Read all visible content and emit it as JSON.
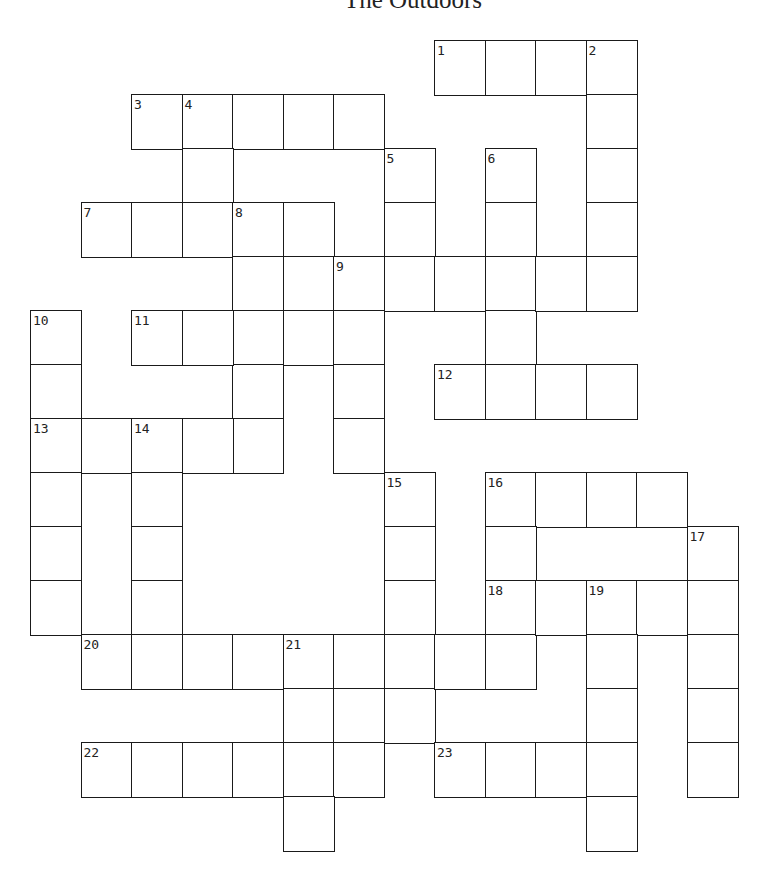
{
  "title": "The Outdoors",
  "grid": {
    "origin": [
      30,
      40
    ],
    "cell_w": 50.5,
    "cell_h": 54,
    "border_color": "#1a1a1a",
    "cells": [
      [
        8,
        0,
        "1"
      ],
      [
        9,
        0
      ],
      [
        10,
        0
      ],
      [
        11,
        0,
        "2"
      ],
      [
        11,
        1
      ],
      [
        11,
        2
      ],
      [
        11,
        3
      ],
      [
        11,
        4
      ],
      [
        2,
        1,
        "3"
      ],
      [
        3,
        1,
        "4"
      ],
      [
        4,
        1
      ],
      [
        5,
        1
      ],
      [
        6,
        1
      ],
      [
        3,
        2
      ],
      [
        3,
        3
      ],
      [
        7,
        2,
        "5"
      ],
      [
        7,
        3
      ],
      [
        7,
        4
      ],
      [
        9,
        2,
        "6"
      ],
      [
        9,
        3
      ],
      [
        9,
        4
      ],
      [
        9,
        5
      ],
      [
        9,
        6
      ],
      [
        1,
        3,
        "7"
      ],
      [
        2,
        3
      ],
      [
        4,
        3,
        "8"
      ],
      [
        5,
        3
      ],
      [
        4,
        4
      ],
      [
        4,
        5
      ],
      [
        4,
        6
      ],
      [
        4,
        7
      ],
      [
        5,
        4
      ],
      [
        5,
        5
      ],
      [
        6,
        4,
        "9"
      ],
      [
        8,
        4
      ],
      [
        10,
        4
      ],
      [
        6,
        5
      ],
      [
        6,
        6
      ],
      [
        6,
        7
      ],
      [
        0,
        5,
        "10"
      ],
      [
        0,
        6
      ],
      [
        0,
        7,
        "13"
      ],
      [
        0,
        8
      ],
      [
        0,
        9
      ],
      [
        0,
        10
      ],
      [
        2,
        5,
        "11"
      ],
      [
        3,
        5
      ],
      [
        8,
        6,
        "12"
      ],
      [
        10,
        6
      ],
      [
        11,
        6
      ],
      [
        1,
        7
      ],
      [
        2,
        7,
        "14"
      ],
      [
        3,
        7
      ],
      [
        2,
        8
      ],
      [
        2,
        9
      ],
      [
        2,
        10
      ],
      [
        7,
        8,
        "15"
      ],
      [
        7,
        9
      ],
      [
        7,
        10
      ],
      [
        7,
        11
      ],
      [
        7,
        12
      ],
      [
        9,
        8,
        "16"
      ],
      [
        10,
        8
      ],
      [
        11,
        8
      ],
      [
        12,
        8
      ],
      [
        9,
        9
      ],
      [
        9,
        10,
        "18"
      ],
      [
        9,
        11
      ],
      [
        13,
        9,
        "17"
      ],
      [
        13,
        10
      ],
      [
        13,
        11
      ],
      [
        13,
        12
      ],
      [
        13,
        13
      ],
      [
        10,
        10
      ],
      [
        11,
        10,
        "19"
      ],
      [
        12,
        10
      ],
      [
        11,
        11
      ],
      [
        11,
        12
      ],
      [
        11,
        13
      ],
      [
        11,
        14
      ],
      [
        1,
        11,
        "20"
      ],
      [
        2,
        11
      ],
      [
        3,
        11
      ],
      [
        4,
        11
      ],
      [
        5,
        11,
        "21"
      ],
      [
        6,
        11
      ],
      [
        8,
        11
      ],
      [
        5,
        12
      ],
      [
        6,
        12
      ],
      [
        5,
        13
      ],
      [
        6,
        13
      ],
      [
        5,
        14
      ],
      [
        1,
        13,
        "22"
      ],
      [
        2,
        13
      ],
      [
        3,
        13
      ],
      [
        4,
        13
      ],
      [
        8,
        13,
        "23"
      ],
      [
        9,
        13
      ],
      [
        10,
        13
      ]
    ]
  },
  "clues": {
    "across": [
      {
        "number": "1",
        "start": [
          8,
          0
        ],
        "length": 4
      },
      {
        "number": "3",
        "start": [
          2,
          1
        ],
        "length": 5
      },
      {
        "number": "7",
        "start": [
          1,
          3
        ],
        "length": 5
      },
      {
        "number": "9",
        "start": [
          6,
          4
        ],
        "length": 6
      },
      {
        "number": "11",
        "start": [
          2,
          5
        ],
        "length": 5
      },
      {
        "number": "12",
        "start": [
          8,
          6
        ],
        "length": 4
      },
      {
        "number": "13",
        "start": [
          0,
          7
        ],
        "length": 5
      },
      {
        "number": "16",
        "start": [
          9,
          8
        ],
        "length": 4
      },
      {
        "number": "18",
        "start": [
          9,
          10
        ],
        "length": 5
      },
      {
        "number": "20",
        "start": [
          1,
          11
        ],
        "length": 9
      },
      {
        "number": "22",
        "start": [
          1,
          13
        ],
        "length": 6
      },
      {
        "number": "23",
        "start": [
          8,
          13
        ],
        "length": 4
      }
    ],
    "down": [
      {
        "number": "2",
        "start": [
          11,
          0
        ],
        "length": 5
      },
      {
        "number": "4",
        "start": [
          3,
          1
        ],
        "length": 3
      },
      {
        "number": "5",
        "start": [
          7,
          2
        ],
        "length": 3
      },
      {
        "number": "6",
        "start": [
          9,
          2
        ],
        "length": 5
      },
      {
        "number": "8",
        "start": [
          4,
          3
        ],
        "length": 5
      },
      {
        "number": "9",
        "start": [
          6,
          4
        ],
        "length": 4
      },
      {
        "number": "10",
        "start": [
          0,
          5
        ],
        "length": 6
      },
      {
        "number": "14",
        "start": [
          2,
          7
        ],
        "length": 4
      },
      {
        "number": "15",
        "start": [
          7,
          8
        ],
        "length": 5
      },
      {
        "number": "16",
        "start": [
          9,
          8
        ],
        "length": 4
      },
      {
        "number": "17",
        "start": [
          13,
          9
        ],
        "length": 5
      },
      {
        "number": "19",
        "start": [
          11,
          10
        ],
        "length": 5
      },
      {
        "number": "21",
        "start": [
          5,
          11
        ],
        "length": 4
      }
    ]
  }
}
